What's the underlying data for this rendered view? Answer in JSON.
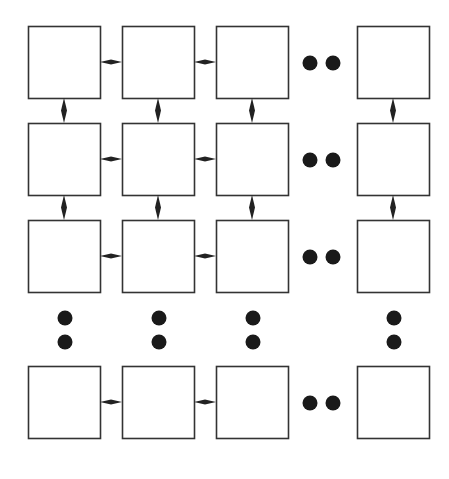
{
  "diagram": {
    "type": "2d-mesh-grid",
    "colors": {
      "stroke": "#333333",
      "fill": "#ffffff",
      "connector": "#222222",
      "dot": "#1a1a1a"
    },
    "columns_x": [
      28,
      122,
      216,
      357
    ],
    "rows_y": [
      26,
      123,
      220,
      366
    ],
    "box_size": 72,
    "ellipsis_columns": {
      "dot_x": [
        310,
        333
      ]
    },
    "ellipsis_rows": {
      "dot_y": [
        318,
        342
      ]
    },
    "node_count_visible": 16
  }
}
